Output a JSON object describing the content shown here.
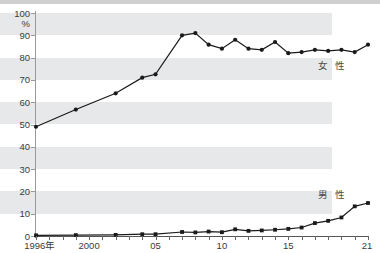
{
  "chart_data": {
    "type": "line",
    "title": "",
    "xlabel": "",
    "ylabel": "%",
    "unit_label": "%",
    "x": [
      1996,
      1997,
      1998,
      1999,
      2000,
      2001,
      2002,
      2003,
      2004,
      2005,
      2006,
      2007,
      2008,
      2009,
      2010,
      2011,
      2012,
      2013,
      2014,
      2015,
      2016,
      2017,
      2018,
      2019,
      2020,
      2021
    ],
    "categories": [
      "1996年",
      "",
      "",
      "",
      "2000",
      "",
      "",
      "",
      "",
      "05",
      "",
      "",
      "",
      "",
      "10",
      "",
      "",
      "",
      "",
      "15",
      "",
      "",
      "",
      "",
      "",
      "21"
    ],
    "xtick_labels": [
      "1996年",
      "2000",
      "05",
      "10",
      "15",
      "21"
    ],
    "xtick_values": [
      1996,
      2000,
      2005,
      2010,
      2015,
      2021
    ],
    "ytick_labels": [
      "0",
      "10",
      "20",
      "30",
      "40",
      "50",
      "60",
      "70",
      "80",
      "90",
      "100"
    ],
    "ytick_values": [
      0,
      10,
      20,
      30,
      40,
      50,
      60,
      70,
      80,
      90,
      100
    ],
    "xlim": [
      1996,
      2021
    ],
    "ylim": [
      0,
      100
    ],
    "grid": "horizontal-bands",
    "banded_ranges": [
      [
        10,
        20
      ],
      [
        30,
        40
      ],
      [
        50,
        60
      ],
      [
        70,
        80
      ],
      [
        90,
        100
      ]
    ],
    "legend_position": "inline-right",
    "series": [
      {
        "name": "女性",
        "label": "女 性",
        "color": "#1a1a1a",
        "marker": "circle",
        "x": [
          1996,
          1999,
          2002,
          2004,
          2005,
          2007,
          2008,
          2009,
          2010,
          2011,
          2012,
          2013,
          2014,
          2015,
          2016,
          2017,
          2018,
          2019,
          2020,
          2021
        ],
        "values": [
          49,
          56.7,
          64,
          71,
          72.5,
          90,
          91,
          85.8,
          84,
          88,
          84,
          83.5,
          87,
          82,
          82.5,
          83.5,
          83,
          83.5,
          82.5,
          85.8
        ]
      },
      {
        "name": "男性",
        "label": "男 性",
        "color": "#1a1a1a",
        "marker": "square",
        "x": [
          1996,
          1999,
          2002,
          2004,
          2005,
          2007,
          2008,
          2009,
          2010,
          2011,
          2012,
          2013,
          2014,
          2015,
          2016,
          2017,
          2018,
          2019,
          2020,
          2021
        ],
        "values": [
          0.3,
          0.4,
          0.5,
          0.8,
          0.8,
          1.8,
          1.6,
          2.0,
          1.7,
          3.0,
          2.3,
          2.5,
          2.8,
          3.2,
          3.8,
          5.8,
          6.8,
          8.3,
          13.3,
          14.8
        ]
      }
    ],
    "annotations": [
      {
        "text": "女 性",
        "x": 2018.6,
        "y": 76.5
      },
      {
        "text": "男 性",
        "x": 2018.6,
        "y": 18.5
      }
    ]
  }
}
